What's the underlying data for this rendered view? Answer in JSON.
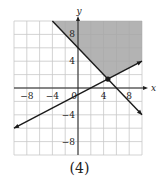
{
  "figure": {
    "caption": "(4)"
  },
  "chart_data": {
    "type": "line",
    "title": "",
    "xlabel": "x",
    "ylabel": "y",
    "xlim": [
      -10,
      10
    ],
    "ylim": [
      -10,
      10
    ],
    "grid": true,
    "grid_step": 2,
    "x_tick_labels": [
      "-8",
      "-4",
      "0",
      "4",
      "8"
    ],
    "x_ticks": [
      -8,
      -4,
      0,
      4,
      8
    ],
    "y_tick_labels": [
      "8",
      "4",
      "-4",
      "-8"
    ],
    "y_ticks": [
      8,
      4,
      -4,
      -8
    ],
    "series": [
      {
        "name": "line-decreasing",
        "equation": "y = -x + 6",
        "x": [
          -4,
          10
        ],
        "y": [
          10,
          -4
        ],
        "arrows": "end"
      },
      {
        "name": "line-increasing",
        "equation": "y = 0.5x - 1",
        "x": [
          -10,
          10
        ],
        "y": [
          -6,
          4
        ],
        "arrows": "both"
      }
    ],
    "intersection_point": {
      "x": 4.67,
      "y": 1.33
    },
    "shaded_region": {
      "description": "region above both lines (y >= -x + 6 and y >= 0.5x - 1)",
      "polygon": [
        [
          -4,
          10
        ],
        [
          10,
          10
        ],
        [
          10,
          4
        ],
        [
          4.67,
          1.33
        ]
      ],
      "color": "#a6a6a6"
    },
    "colors": {
      "grid": "#c8c8c8",
      "axes": "#222222",
      "lines": "#1a1a1a",
      "shade": "#a6a6a6"
    }
  }
}
